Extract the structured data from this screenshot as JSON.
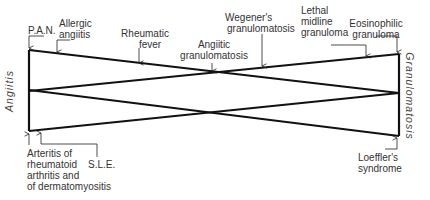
{
  "diagram": {
    "left_axis_label": "Angiitis",
    "right_axis_label": "Granulomatosis",
    "top_labels": {
      "pan": "P.A.N.",
      "allergic_angiitis": [
        "Allergic",
        "angiitis"
      ],
      "rheumatic_fever": [
        "Rheumatic",
        "fever"
      ],
      "angiitic_granulomatosis": [
        "Angiitic",
        "granulomatosis"
      ],
      "wegeners_granulomatosis": [
        "Wegener's",
        "granulomatosis"
      ],
      "lethal_midline_granuloma": [
        "Lethal",
        "midline",
        "granuloma"
      ],
      "eosinophilic_granuloma": [
        "Eosinophilic",
        "granuloma"
      ]
    },
    "bottom_labels": {
      "arteritis": [
        "Arteritis of",
        "rheumatoid",
        "arthritis and",
        "of dermatomyositis"
      ],
      "sle": "S.L.E.",
      "loefflers_syndrome": [
        "Loeffler's",
        "syndrome"
      ]
    },
    "line_color": "#111111"
  }
}
